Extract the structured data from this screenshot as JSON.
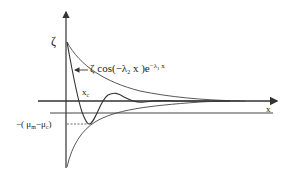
{
  "diagram": {
    "type": "damped-oscillation-plot",
    "colors": {
      "line": "#333333",
      "background": "#ffffff"
    },
    "labels": {
      "y_axis": "ζ",
      "x_axis": "x",
      "formula": {
        "prefix": "ζ cos(−λ",
        "sub1": "2",
        "mid": " x )e",
        "exp_pre": "−λ",
        "exp_sub": "1",
        "exp_post": " x"
      },
      "xc": {
        "main": "x",
        "sub": "c"
      },
      "offset": {
        "pre": "−( μ",
        "sub_m": "m",
        "mid": "−μ",
        "sub_c": "c",
        "post": ")"
      }
    },
    "elements": [
      "vertical axis with arrow (ζ)",
      "horizontal axis with arrow (x)",
      "second horizontal reference line below x-axis",
      "upper decaying envelope",
      "lower envelope",
      "damped cosine curve",
      "dashed line marking −(μm−μc) level at curve minimum",
      "arrow pointing from formula to curve"
    ]
  }
}
